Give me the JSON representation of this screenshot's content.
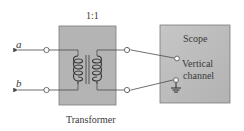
{
  "diagram": {
    "type": "circuit-schematic",
    "transformer": {
      "ratio_label": "1:1",
      "caption": "Transformer",
      "fill_color": "#b4b4b4"
    },
    "terminals": {
      "a_label": "a",
      "b_label": "b"
    },
    "scope": {
      "title": "Scope",
      "input_label_line1": "Vertical",
      "input_label_line2": "channel",
      "fill_color": "#bdbdbd"
    },
    "colors": {
      "wire": "#4a4a4a",
      "text": "#3a3a3a",
      "box_border": "#7a7a7a"
    }
  }
}
